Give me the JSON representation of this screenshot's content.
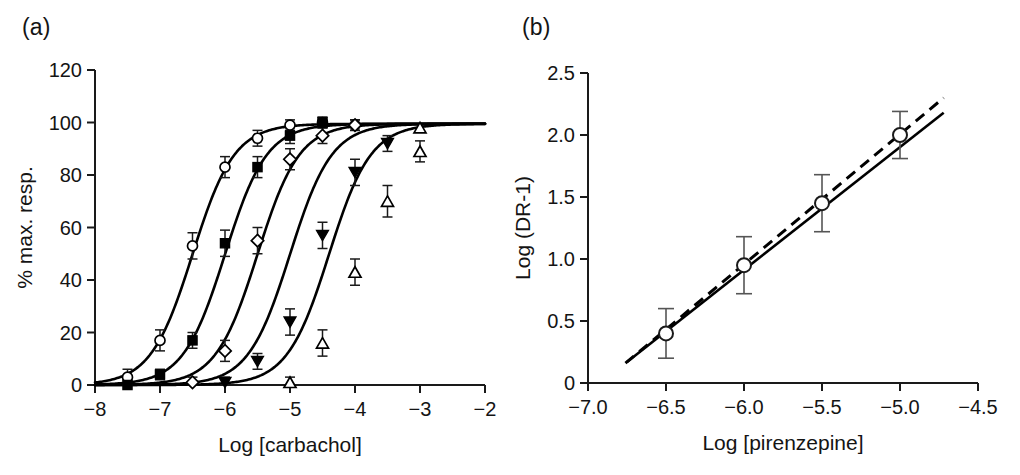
{
  "figure": {
    "panels": [
      {
        "label": "(a)"
      },
      {
        "label": "(b)"
      }
    ]
  },
  "chart_data": [
    {
      "panel": "(a)",
      "panel_label": "(a)",
      "type": "line",
      "title": "",
      "xlabel": "Log [carbachol]",
      "ylabel": "% max. resp.",
      "xlim": [
        -8,
        -2
      ],
      "ylim": [
        0,
        120
      ],
      "xticks": [
        -8,
        -7,
        -6,
        -5,
        -4,
        -3,
        -2
      ],
      "xticklabels": [
        "−8",
        "−7",
        "−6",
        "−5",
        "−4",
        "−3",
        "−2"
      ],
      "yticks": [
        0,
        20,
        40,
        60,
        80,
        100,
        120
      ],
      "yticklabels": [
        "0",
        "20",
        "40",
        "60",
        "80",
        "100",
        "120"
      ],
      "grid": false,
      "legend": "none",
      "series": [
        {
          "name": "control",
          "marker": "open-circle",
          "ec50": -6.5,
          "hill": 1.35,
          "top": 99.5,
          "x": [
            -7.5,
            -7.0,
            -6.5,
            -6.0,
            -5.5,
            -5.0,
            -4.5,
            -4.0
          ],
          "values": [
            3,
            17,
            53,
            83,
            94,
            99,
            100,
            99
          ],
          "errors": [
            3,
            4,
            5,
            4,
            3,
            2,
            2,
            2
          ]
        },
        {
          "name": "pirenzepine 10^-6.5 M",
          "marker": "filled-square",
          "ec50": -6.0,
          "hill": 1.35,
          "top": 99.5,
          "x": [
            -7.5,
            -7.0,
            -6.5,
            -6.0,
            -5.5,
            -5.0,
            -4.5
          ],
          "values": [
            0,
            4,
            17,
            54,
            83,
            95,
            100
          ],
          "errors": [
            2,
            2,
            3,
            5,
            4,
            3,
            2
          ]
        },
        {
          "name": "pirenzepine 10^-6.0 M",
          "marker": "open-diamond",
          "ec50": -5.5,
          "hill": 1.35,
          "top": 99.5,
          "x": [
            -6.5,
            -6.0,
            -5.5,
            -5.0,
            -4.5,
            -4.0
          ],
          "values": [
            1,
            13,
            55,
            86,
            95,
            99
          ],
          "errors": [
            2,
            4,
            5,
            4,
            3,
            2
          ]
        },
        {
          "name": "pirenzepine 10^-5.5 M",
          "marker": "filled-triangle-down",
          "ec50": -5.0,
          "hill": 1.35,
          "top": 99.5,
          "x": [
            -6.0,
            -5.5,
            -5.0,
            -4.5,
            -4.0,
            -3.5
          ],
          "values": [
            1,
            9,
            24,
            57,
            81,
            92
          ],
          "errors": [
            2,
            3,
            5,
            5,
            5,
            3
          ]
        },
        {
          "name": "pirenzepine 10^-5.0 M",
          "marker": "open-triangle-up",
          "ec50": -4.4,
          "hill": 1.35,
          "top": 99.5,
          "x": [
            -5.0,
            -4.5,
            -4.0,
            -3.5,
            -3.0
          ],
          "values": [
            1,
            16,
            43,
            70,
            89
          ],
          "errors": [
            2,
            5,
            5,
            6,
            4
          ],
          "extra_x": [
            -3.0
          ],
          "extra_values": [
            98
          ]
        }
      ]
    },
    {
      "panel": "(b)",
      "panel_label": "(b)",
      "type": "scatter",
      "title": "",
      "xlabel": "Log [pirenzepine]",
      "ylabel": "Log (DR-1)",
      "xlim": [
        -7.0,
        -4.5
      ],
      "ylim": [
        0,
        2.5
      ],
      "xticks": [
        -7.0,
        -6.5,
        -6.0,
        -5.5,
        -5.0,
        -4.5
      ],
      "xticklabels": [
        "−7.0",
        "−6.5",
        "−6.0",
        "−5.5",
        "−5.0",
        "−4.5"
      ],
      "yticks": [
        0,
        0.5,
        1.0,
        1.5,
        2.0,
        2.5
      ],
      "yticklabels": [
        "0",
        "0.5",
        "1.0",
        "1.5",
        "2.0",
        "2.5"
      ],
      "grid": false,
      "legend": "none",
      "series": [
        {
          "name": "Schild data",
          "marker": "open-circle",
          "x": [
            -6.5,
            -6.0,
            -5.5,
            -5.0
          ],
          "values": [
            0.4,
            0.95,
            1.45,
            2.0
          ],
          "errors": [
            0.2,
            0.23,
            0.23,
            0.19
          ]
        }
      ],
      "lines": [
        {
          "name": "regression-fit",
          "style": "solid",
          "x": [
            -6.75,
            -4.72
          ],
          "values": [
            0.17,
            2.18
          ],
          "slope": 0.99,
          "intercept": 6.85
        },
        {
          "name": "unit-slope-constrained",
          "style": "dashed",
          "x": [
            -6.76,
            -4.72
          ],
          "values": [
            0.16,
            2.3
          ],
          "slope": 1.05,
          "intercept": 7.25
        }
      ]
    }
  ]
}
